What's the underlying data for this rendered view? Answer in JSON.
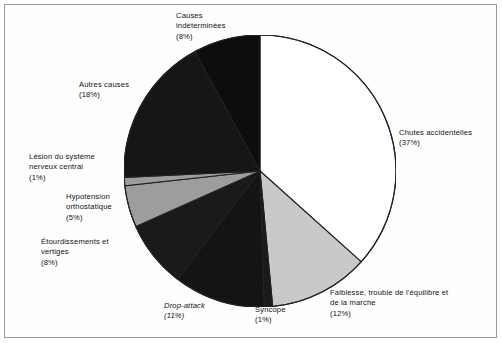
{
  "figure": {
    "frame_color": "#9a9a9a",
    "background": "#ffffff"
  },
  "chart_data": {
    "type": "pie",
    "title": "",
    "subtitle": "",
    "xlabel": "",
    "ylabel": "",
    "grid": false,
    "legend_position": "none",
    "label_format": "name (percent%)",
    "start_angle_deg": 0,
    "direction": "clockwise",
    "center_px": [
      260,
      171
    ],
    "radius_px": 136,
    "total_percent": 101,
    "categories": [
      "Chutes accidentelles",
      "Faiblesse, trouble de l'équilibre et de la marche",
      "Syncope",
      "Drop-attack",
      "Étourdissements et vertiges",
      "Hypotension orthostatique",
      "Lésion du système nerveux central",
      "Autres causes",
      "Causes indéterminées"
    ],
    "values": [
      37,
      12,
      1,
      11,
      8,
      5,
      1,
      18,
      8
    ],
    "value_labels": [
      "(37%)",
      "(12%)",
      "(1%)",
      "(11%)",
      "(8%)",
      "(5%)",
      "(1%)",
      "(18%)",
      "(8%)"
    ],
    "colors": [
      "#ffffff",
      "#c9c9c9",
      "#1a1a1a",
      "#141414",
      "#1a1a1a",
      "#9d9d9d",
      "#9d9d9d",
      "#161616",
      "#0d0d0d"
    ],
    "slice_edge_color": "#222222",
    "slices": [
      {
        "name": "Chutes accidentelles",
        "value": 37,
        "color": "#ffffff"
      },
      {
        "name": "Faiblesse, trouble de l'équilibre et de la marche",
        "value": 12,
        "color": "#c9c9c9"
      },
      {
        "name": "Syncope",
        "value": 1,
        "color": "#1a1a1a"
      },
      {
        "name": "Drop-attack",
        "value": 11,
        "color": "#141414"
      },
      {
        "name": "Étourdissements et vertiges",
        "value": 8,
        "color": "#1a1a1a"
      },
      {
        "name": "Hypotension orthostatique",
        "value": 5,
        "color": "#9d9d9d"
      },
      {
        "name": "Lésion du système nerveux central",
        "value": 1,
        "color": "#9d9d9d"
      },
      {
        "name": "Autres causes",
        "value": 18,
        "color": "#161616"
      },
      {
        "name": "Causes indéterminées",
        "value": 8,
        "color": "#0d0d0d"
      }
    ]
  },
  "labels": {
    "chutes": "Chutes accidentelles\n(37%)",
    "faiblesse": "Faiblesse, trouble de l'équilibre et\nde la marche\n(12%)",
    "syncope": "Syncope\n(1%)",
    "drop_attack": "Drop-attack\n(11%)",
    "etourdissements": "Étourdissements et\nvertiges\n(8%)",
    "hypotension": "Hypotension\northostatique\n(5%)",
    "lesion": "Lésion du système\nnerveux central\n(1%)",
    "autres": "Autres causes\n(18%)",
    "indeterminees": "Causes\nindéterminées\n(8%)"
  }
}
